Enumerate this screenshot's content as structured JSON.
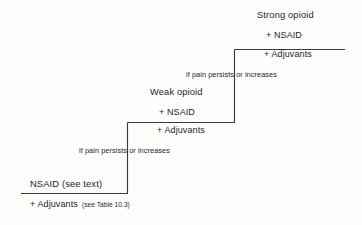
{
  "figure": {
    "name": "analgesic-ladder",
    "type": "stepped-flow-diagram",
    "background_color": "#fdfdfc",
    "line_color": "#3a3a3a"
  },
  "steps": [
    {
      "id": "step-1",
      "level": 1,
      "position": "bottom",
      "title": "NSAID (see text)",
      "lines": [
        "+ Adjuvants"
      ],
      "note": "(see Table 10.3)"
    },
    {
      "id": "step-2",
      "level": 2,
      "position": "middle",
      "title": "Weak opioid",
      "lines": [
        "+ NSAID",
        "+ Adjuvants"
      ],
      "note": ""
    },
    {
      "id": "step-3",
      "level": 3,
      "position": "top",
      "title": "Strong opioid",
      "lines": [
        "+ NSAID",
        "+ Adjuvants"
      ],
      "note": ""
    }
  ],
  "connectors": [
    {
      "id": "connector-1",
      "from": "step-1",
      "to": "step-2",
      "label": "if pain persists or increases"
    },
    {
      "id": "connector-2",
      "from": "step-2",
      "to": "step-3",
      "label": "if pain persists or increases"
    }
  ]
}
